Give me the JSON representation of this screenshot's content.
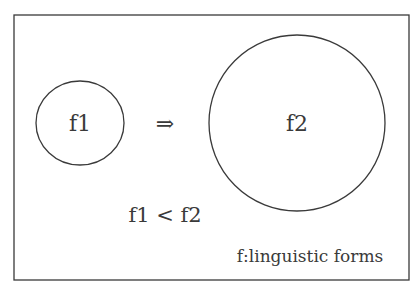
{
  "diagram": {
    "nodes": [
      {
        "id": "f1",
        "label": "f1",
        "shape": "circle",
        "size": "small"
      },
      {
        "id": "f2",
        "label": "f2",
        "shape": "circle",
        "size": "large"
      }
    ],
    "arrow": {
      "symbol": "⇒",
      "from": "f1",
      "to": "f2"
    },
    "relation": "f1 < f2",
    "legend": "f:linguistic forms",
    "colors": {
      "stroke": "#3a3a3a",
      "background": "#ffffff"
    }
  }
}
